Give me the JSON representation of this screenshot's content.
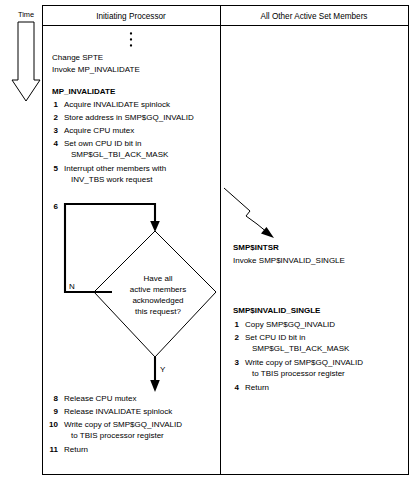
{
  "diagram": {
    "time_axis": {
      "label": "Time",
      "arrow_icon": "down-arrow-icon"
    },
    "columns": [
      {
        "id": "initiating-processor",
        "header": "Initiating Processor"
      },
      {
        "id": "all-other-active-set-members",
        "header": "All Other Active Set Members"
      }
    ],
    "left_column": {
      "ellipsis": "vertical-ellipsis",
      "preamble": [
        "Change SPTE",
        "Invoke MP_INVALIDATE"
      ],
      "routine_title": "MP_INVALIDATE",
      "steps": [
        {
          "num": "1",
          "lines": [
            "Acquire INVALIDATE spinlock"
          ]
        },
        {
          "num": "2",
          "lines": [
            "Store address in SMP$GQ_INVALID"
          ]
        },
        {
          "num": "3",
          "lines": [
            "Acquire CPU mutex"
          ]
        },
        {
          "num": "4",
          "lines": [
            "Set own CPU ID bit in",
            "SMP$GL_TBI_ACK_MASK"
          ]
        },
        {
          "num": "5",
          "lines": [
            "Interrupt other members with",
            "INV_TBS work request"
          ]
        }
      ],
      "loop_step_num": "6",
      "decision": {
        "lines": [
          "Have all",
          "active members",
          "acknowledged",
          "this request?"
        ],
        "no_label": "N",
        "yes_label": "Y"
      },
      "steps_after": [
        {
          "num": "8",
          "lines": [
            "Release CPU mutex"
          ]
        },
        {
          "num": "9",
          "lines": [
            "Release INVALIDATE spinlock"
          ]
        },
        {
          "num": "10",
          "lines": [
            "Write copy of SMP$GQ_INVALID",
            "to TBIS processor register"
          ]
        },
        {
          "num": "11",
          "lines": [
            "Return"
          ]
        }
      ]
    },
    "right_column": {
      "interrupt_arrow_icon": "lightning-bolt-arrow-icon",
      "isr_title": "SMP$INTSR",
      "isr_body": "Invoke SMP$INVALID_SINGLE",
      "routine_title": "SMP$INVALID_SINGLE",
      "steps": [
        {
          "num": "1",
          "lines": [
            "Copy SMP$GQ_INVALID"
          ]
        },
        {
          "num": "2",
          "lines": [
            "Set CPU ID bit in",
            "SMP$GL_TBI_ACK_MASK"
          ]
        },
        {
          "num": "3",
          "lines": [
            "Write copy of SMP$GQ_INVALID",
            "to TBIS processor register"
          ]
        },
        {
          "num": "4",
          "lines": [
            "Return"
          ]
        }
      ]
    },
    "colors": {
      "ink": "#000000",
      "paper": "#ffffff"
    }
  }
}
